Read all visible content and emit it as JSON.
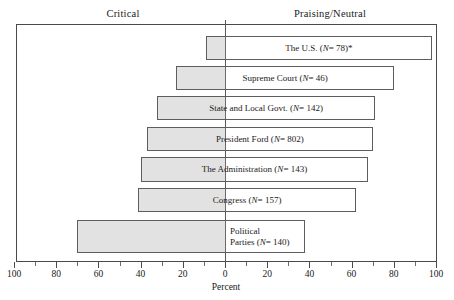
{
  "chart_data": {
    "type": "bar",
    "subtype": "diverging-horizontal-bar",
    "title": "",
    "xlabel": "Percent",
    "ylabel": "",
    "grid": false,
    "legend_position": "top",
    "axis": {
      "left_heading": "Critical",
      "right_heading": "Praising/Neutral",
      "tick_labels": [
        "100",
        "80",
        "60",
        "40",
        "20",
        "0",
        "20",
        "40",
        "60",
        "80",
        "100"
      ],
      "tick_values": [
        -100,
        -80,
        -60,
        -40,
        -20,
        0,
        20,
        40,
        60,
        80,
        100
      ],
      "minor_tick_step": 10,
      "xlim": [
        -100,
        100
      ]
    },
    "categories": [
      "The U.S.",
      "Supreme Court",
      "State and Local Govt.",
      "President Ford",
      "The Administration",
      "Congress",
      "Political Parties"
    ],
    "series": [
      {
        "name": "Critical",
        "values": [
          9,
          23,
          32,
          37,
          40,
          41,
          70
        ]
      },
      {
        "name": "Praising/Neutral",
        "values": [
          98,
          80,
          71,
          70,
          68,
          62,
          38
        ]
      }
    ],
    "rows": [
      {
        "label_line1": "The U.S. (",
        "label_italic": "N",
        "label_line2": "= 78)*",
        "label_full": "The U.S. (N= 78)*",
        "n": 78,
        "critical": 9,
        "praising": 98,
        "footnote_marker": "*",
        "two_line": false
      },
      {
        "label_line1": "Supreme Court (",
        "label_italic": "N",
        "label_line2": "= 46)",
        "label_full": "Supreme Court (N= 46)",
        "n": 46,
        "critical": 23,
        "praising": 80,
        "footnote_marker": "",
        "two_line": false
      },
      {
        "label_line1": "State and Local Govt. (",
        "label_italic": "N",
        "label_line2": "= 142)",
        "label_full": "State and Local Govt. (N= 142)",
        "n": 142,
        "critical": 32,
        "praising": 71,
        "footnote_marker": "",
        "two_line": false
      },
      {
        "label_line1": "President Ford (",
        "label_italic": "N",
        "label_line2": "= 802)",
        "label_full": "President Ford (N= 802)",
        "n": 802,
        "critical": 37,
        "praising": 70,
        "footnote_marker": "",
        "two_line": false
      },
      {
        "label_line1": "The Administration (",
        "label_italic": "N",
        "label_line2": "= 143)",
        "label_full": "The Administration (N= 143)",
        "n": 143,
        "critical": 40,
        "praising": 68,
        "footnote_marker": "",
        "two_line": false
      },
      {
        "label_line1": "Congress (",
        "label_italic": "N",
        "label_line2": "= 157)",
        "label_full": "Congress (N= 157)",
        "n": 157,
        "critical": 41,
        "praising": 62,
        "footnote_marker": "",
        "two_line": false
      },
      {
        "label_line1": "Political\nParties (",
        "label_italic": "N",
        "label_line2": "= 140)",
        "label_full": "Political Parties (N= 140)",
        "n": 140,
        "critical": 70,
        "praising": 38,
        "footnote_marker": "",
        "two_line": true
      }
    ],
    "colors": {
      "critical_fill": "#e2e2e2",
      "praising_fill": "#ffffff",
      "bar_border": "#5d5d5d",
      "frame": "#4a4a4a",
      "text": "#1a1a1a"
    }
  }
}
